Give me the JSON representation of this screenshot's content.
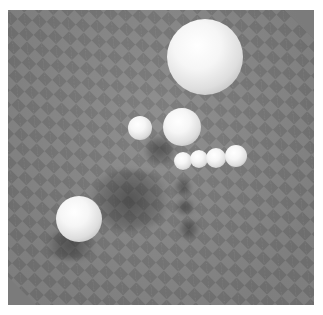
{
  "scene": {
    "description": "Rendered 3D scene of white spheres floating above a gray checkered plane with soft shadows",
    "colors": {
      "background": "#ffffff",
      "checker_light": "#8a8a8a",
      "checker_dark": "#777777",
      "sphere": "#f4f4f4"
    },
    "spheres": [
      {
        "id": "large-top",
        "cx": 205,
        "cy": 57,
        "r": 38
      },
      {
        "id": "small-left",
        "cx": 140,
        "cy": 128,
        "r": 12
      },
      {
        "id": "medium-center",
        "cx": 182,
        "cy": 127,
        "r": 19
      },
      {
        "id": "row-1",
        "cx": 183,
        "cy": 161,
        "r": 9
      },
      {
        "id": "row-2",
        "cx": 199,
        "cy": 159,
        "r": 9
      },
      {
        "id": "row-3",
        "cx": 216,
        "cy": 158,
        "r": 10
      },
      {
        "id": "row-4",
        "cx": 236,
        "cy": 156,
        "r": 11
      },
      {
        "id": "lower-left",
        "cx": 79,
        "cy": 219,
        "r": 23
      }
    ],
    "shadows": [
      {
        "cx": 130,
        "cy": 200,
        "rx": 45,
        "ry": 30
      },
      {
        "cx": 160,
        "cy": 150,
        "rx": 18,
        "ry": 14
      },
      {
        "cx": 183,
        "cy": 187,
        "rx": 10,
        "ry": 8
      },
      {
        "cx": 185,
        "cy": 207,
        "rx": 11,
        "ry": 8
      },
      {
        "cx": 189,
        "cy": 229,
        "rx": 12,
        "ry": 9
      },
      {
        "cx": 70,
        "cy": 245,
        "rx": 28,
        "ry": 15
      }
    ]
  }
}
